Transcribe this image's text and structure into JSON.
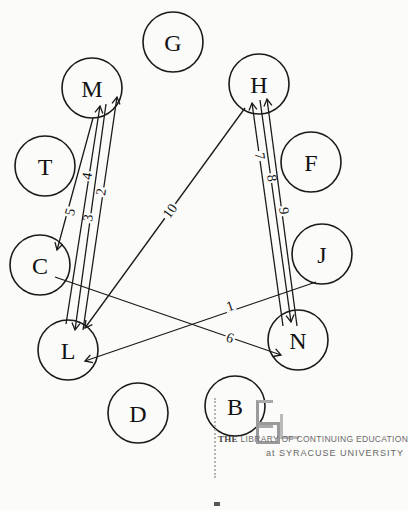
{
  "diagram": {
    "type": "sociogram",
    "nodes": [
      {
        "id": "G",
        "label": "G",
        "x": 173,
        "y": 42,
        "r": 30
      },
      {
        "id": "M",
        "label": "M",
        "x": 92,
        "y": 88,
        "r": 30
      },
      {
        "id": "H",
        "label": "H",
        "x": 259,
        "y": 84,
        "r": 30
      },
      {
        "id": "T",
        "label": "T",
        "x": 45,
        "y": 166,
        "r": 30
      },
      {
        "id": "F",
        "label": "F",
        "x": 311,
        "y": 162,
        "r": 30
      },
      {
        "id": "C",
        "label": "C",
        "x": 40,
        "y": 265,
        "r": 30
      },
      {
        "id": "J",
        "label": "J",
        "x": 322,
        "y": 254,
        "r": 30
      },
      {
        "id": "L",
        "label": "L",
        "x": 68,
        "y": 350,
        "r": 30
      },
      {
        "id": "N",
        "label": "N",
        "x": 298,
        "y": 340,
        "r": 30
      },
      {
        "id": "D",
        "label": "D",
        "x": 138,
        "y": 413,
        "r": 30
      },
      {
        "id": "B",
        "label": "B",
        "x": 235,
        "y": 406,
        "r": 30
      }
    ],
    "edges": [
      {
        "label": "1",
        "from": "J",
        "to": "L",
        "x1": 316,
        "y1": 282,
        "x2": 85,
        "y2": 361,
        "lx": 230,
        "ly": 306
      },
      {
        "label": "2",
        "from": "L",
        "to": "M",
        "x1": 83,
        "y1": 330,
        "x2": 117,
        "y2": 97,
        "lx": 101,
        "ly": 192
      },
      {
        "label": "3",
        "from": "M",
        "to": "L",
        "x1": 106,
        "y1": 104,
        "x2": 75,
        "y2": 330,
        "lx": 88,
        "ly": 218
      },
      {
        "label": "4",
        "from": "L",
        "to": "M",
        "x1": 66,
        "y1": 324,
        "x2": 100,
        "y2": 106,
        "lx": 87,
        "ly": 176
      },
      {
        "label": "5",
        "from": "M",
        "to": "C",
        "x1": 93,
        "y1": 118,
        "x2": 57,
        "y2": 250,
        "lx": 70,
        "ly": 212
      },
      {
        "label": "6",
        "from": "C",
        "to": "N",
        "x1": 55,
        "y1": 277,
        "x2": 281,
        "y2": 355,
        "lx": 230,
        "ly": 338
      },
      {
        "label": "7",
        "from": "N",
        "to": "H",
        "x1": 283,
        "y1": 326,
        "x2": 252,
        "y2": 103,
        "lx": 260,
        "ly": 156
      },
      {
        "label": "8",
        "from": "H",
        "to": "N",
        "x1": 260,
        "y1": 100,
        "x2": 291,
        "y2": 322,
        "lx": 272,
        "ly": 178
      },
      {
        "label": "9",
        "from": "N",
        "to": "H",
        "x1": 297,
        "y1": 326,
        "x2": 267,
        "y2": 99,
        "lx": 284,
        "ly": 211
      },
      {
        "label": "10",
        "from": "H",
        "to": "L",
        "x1": 245,
        "y1": 108,
        "x2": 85,
        "y2": 328,
        "lx": 170,
        "ly": 211
      }
    ]
  },
  "stamp": {
    "line1_bold": "THE",
    "line1": "LIBRARY OF CONTINUING EDUCATION",
    "line2": "at SYRACUSE UNIVERSITY"
  }
}
